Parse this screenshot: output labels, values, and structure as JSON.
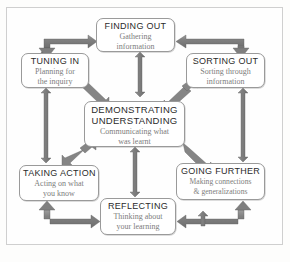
{
  "title_sliver": "",
  "diagram": {
    "name": "inquiry-cycle-diagram",
    "frame_color": "#cfcfcf",
    "arrow_color": "#8c8c8c",
    "arrow_color_dark": "#6f6f6f",
    "box_border_color": "#9a9a9a",
    "heading_color": "#2b2b2b",
    "subtext_color": "#7d7d7d",
    "background_color": "#fefefe"
  },
  "nodes": [
    {
      "id": "finding-out",
      "heading": "FINDING OUT",
      "sub_line1": "Gathering",
      "sub_line2": "information"
    },
    {
      "id": "tuning-in",
      "heading": "TUNING IN",
      "sub_line1": "Planning for",
      "sub_line2": "the inquiry"
    },
    {
      "id": "sorting-out",
      "heading": "SORTING OUT",
      "sub_line1": "Sorting through",
      "sub_line2": "information"
    },
    {
      "id": "demonstrating-understanding",
      "heading_line1": "DEMONSTRATING",
      "heading_line2": "UNDERSTANDING",
      "sub_line1": "Communicating what",
      "sub_line2": "was learnt"
    },
    {
      "id": "taking-action",
      "heading": "TAKING ACTION",
      "sub_line1": "Acting on what",
      "sub_line2": "you  know"
    },
    {
      "id": "going-further",
      "heading": "GOING  FURTHER",
      "sub_line1": "Making connections",
      "sub_line2": "& generalizations"
    },
    {
      "id": "reflecting",
      "heading": "REFLECTING",
      "sub_line1": "Thinking about",
      "sub_line2": "your learning"
    }
  ],
  "connectors": [
    {
      "id": "tuning-in-to-finding-out",
      "style": "elbow",
      "heads": "single"
    },
    {
      "id": "sorting-out-to-finding-out",
      "style": "elbow",
      "heads": "single"
    },
    {
      "id": "finding-out-to-center",
      "style": "vertical",
      "heads": "double"
    },
    {
      "id": "tuning-in-to-center",
      "style": "diagonal",
      "heads": "single"
    },
    {
      "id": "sorting-out-to-center",
      "style": "diagonal",
      "heads": "double"
    },
    {
      "id": "tuning-in-to-taking-action",
      "style": "vertical",
      "heads": "double"
    },
    {
      "id": "sorting-out-to-going-further",
      "style": "vertical",
      "heads": "double"
    },
    {
      "id": "center-to-taking-action",
      "style": "diagonal",
      "heads": "double"
    },
    {
      "id": "center-to-going-further",
      "style": "diagonal",
      "heads": "single"
    },
    {
      "id": "center-to-reflecting",
      "style": "vertical",
      "heads": "double"
    },
    {
      "id": "taking-action-to-reflecting",
      "style": "elbow",
      "heads": "single"
    },
    {
      "id": "going-further-to-reflecting",
      "style": "elbow",
      "heads": "single"
    },
    {
      "id": "reflecting-to-going-further",
      "style": "vertical",
      "heads": "single"
    }
  ]
}
